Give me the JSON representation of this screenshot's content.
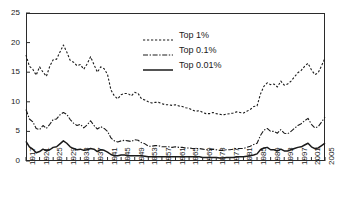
{
  "chart_data": {
    "type": "line",
    "title": "",
    "subtitle": "",
    "xlabel": "",
    "ylabel": "",
    "xlim": [
      1917,
      2005
    ],
    "ylim": [
      0,
      25
    ],
    "grid": false,
    "legend_position": "upper-center",
    "ytick_labels": [
      "0",
      "5",
      "10",
      "15",
      "20",
      "25"
    ],
    "ytick_values": [
      0,
      5,
      10,
      15,
      20,
      25
    ],
    "xtick_labels": [
      "1917",
      "1921",
      "1925",
      "1929",
      "1933",
      "1937",
      "1941",
      "1945",
      "1949",
      "1953",
      "1957",
      "1961",
      "1965",
      "1969",
      "1973",
      "1977",
      "1981",
      "1985",
      "1989",
      "1993",
      "1997",
      "2001",
      "2005"
    ],
    "xtick_values": [
      1917,
      1921,
      1925,
      1929,
      1933,
      1937,
      1941,
      1945,
      1949,
      1953,
      1957,
      1961,
      1965,
      1969,
      1973,
      1977,
      1981,
      1985,
      1989,
      1993,
      1997,
      2001,
      2005
    ],
    "x": [
      1917,
      1918,
      1919,
      1920,
      1921,
      1922,
      1923,
      1924,
      1925,
      1926,
      1927,
      1928,
      1929,
      1930,
      1931,
      1932,
      1933,
      1934,
      1935,
      1936,
      1937,
      1938,
      1939,
      1940,
      1941,
      1942,
      1943,
      1944,
      1945,
      1946,
      1947,
      1948,
      1949,
      1950,
      1951,
      1952,
      1953,
      1954,
      1955,
      1956,
      1957,
      1958,
      1959,
      1960,
      1961,
      1962,
      1963,
      1964,
      1965,
      1966,
      1967,
      1968,
      1969,
      1970,
      1971,
      1972,
      1973,
      1974,
      1975,
      1976,
      1977,
      1978,
      1979,
      1980,
      1981,
      1982,
      1983,
      1984,
      1985,
      1986,
      1987,
      1988,
      1989,
      1990,
      1991,
      1992,
      1993,
      1994,
      1995,
      1996,
      1997,
      1998,
      1999,
      2000,
      2001,
      2002,
      2003,
      2004,
      2005
    ],
    "series": [
      {
        "name": "Top 1%",
        "style": "dashed",
        "color": "#1a1a1a",
        "values": [
          17.9,
          16.0,
          15.5,
          14.5,
          15.9,
          15.0,
          14.3,
          16.0,
          17.1,
          17.2,
          18.4,
          19.6,
          18.4,
          17.0,
          16.7,
          16.1,
          16.3,
          15.5,
          16.4,
          17.6,
          16.3,
          15.0,
          15.9,
          15.6,
          14.6,
          12.0,
          11.0,
          10.5,
          11.2,
          11.4,
          11.4,
          11.0,
          11.6,
          11.4,
          10.5,
          10.3,
          10.0,
          9.8,
          9.9,
          9.9,
          9.7,
          9.5,
          9.5,
          9.4,
          9.5,
          9.3,
          9.2,
          9.0,
          8.9,
          8.6,
          8.4,
          8.5,
          8.2,
          8.0,
          8.0,
          8.2,
          8.0,
          7.9,
          7.8,
          7.9,
          8.0,
          8.1,
          8.3,
          8.2,
          8.1,
          8.4,
          8.7,
          9.2,
          9.3,
          11.3,
          12.6,
          13.2,
          12.9,
          13.0,
          12.5,
          13.5,
          12.8,
          13.0,
          13.5,
          14.2,
          14.9,
          15.3,
          16.0,
          16.5,
          15.4,
          14.6,
          14.9,
          16.1,
          17.4
        ]
      },
      {
        "name": "Top 0.1%",
        "style": "dashdot",
        "color": "#1a1a1a",
        "values": [
          8.7,
          7.1,
          6.6,
          5.5,
          5.3,
          6.0,
          5.5,
          6.2,
          7.0,
          7.1,
          7.8,
          8.2,
          7.9,
          7.0,
          6.4,
          6.0,
          6.2,
          5.6,
          6.1,
          6.8,
          6.0,
          5.4,
          5.8,
          5.5,
          5.0,
          3.9,
          3.4,
          3.2,
          3.4,
          3.5,
          3.4,
          3.3,
          3.6,
          3.5,
          3.1,
          2.9,
          2.5,
          2.5,
          2.6,
          2.6,
          2.4,
          2.4,
          2.4,
          2.3,
          2.4,
          2.3,
          2.3,
          2.2,
          2.2,
          2.1,
          2.1,
          2.1,
          2.0,
          1.9,
          1.9,
          2.0,
          1.9,
          1.8,
          1.8,
          1.9,
          1.9,
          2.0,
          2.1,
          2.1,
          2.1,
          2.3,
          2.5,
          2.8,
          3.0,
          4.3,
          5.2,
          5.5,
          5.0,
          5.0,
          4.7,
          5.3,
          4.7,
          4.6,
          5.0,
          5.5,
          6.0,
          6.3,
          6.8,
          7.2,
          6.2,
          5.6,
          5.8,
          6.6,
          7.4
        ]
      },
      {
        "name": "Top 0.01%",
        "style": "solid",
        "color": "#1a1a1a",
        "values": [
          3.3,
          2.4,
          2.0,
          1.4,
          1.6,
          2.0,
          1.7,
          1.9,
          2.3,
          2.4,
          2.9,
          3.4,
          3.0,
          2.4,
          2.1,
          1.9,
          2.0,
          1.8,
          1.9,
          2.1,
          2.0,
          1.6,
          1.9,
          1.8,
          1.5,
          1.1,
          0.9,
          0.9,
          1.0,
          1.0,
          0.9,
          0.9,
          0.9,
          0.9,
          0.9,
          0.8,
          0.7,
          0.7,
          0.7,
          0.7,
          0.7,
          0.7,
          0.7,
          0.7,
          0.7,
          0.7,
          0.7,
          0.7,
          0.7,
          0.7,
          0.7,
          0.7,
          0.6,
          0.6,
          0.6,
          0.6,
          0.6,
          0.5,
          0.5,
          0.6,
          0.6,
          0.6,
          0.7,
          0.7,
          0.7,
          0.8,
          0.9,
          1.0,
          1.2,
          1.9,
          2.2,
          2.3,
          1.9,
          1.9,
          1.7,
          2.0,
          1.7,
          1.7,
          1.9,
          2.1,
          2.3,
          2.4,
          2.7,
          3.0,
          2.4,
          2.1,
          2.2,
          2.6,
          3.0
        ]
      }
    ],
    "legend": [
      {
        "label": "Top 1%",
        "style": "dashed"
      },
      {
        "label": "Top 0.1%",
        "style": "dashdot"
      },
      {
        "label": "Top 0.01%",
        "style": "solid"
      }
    ]
  }
}
